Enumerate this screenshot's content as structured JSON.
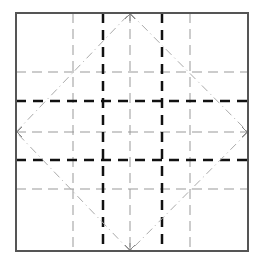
{
  "diagram": {
    "title": "",
    "type": "origami crease pattern",
    "colors": {
      "border": "#555555",
      "valley_thin": "#999999",
      "mountain_thick": "#111111",
      "diagonal": "#aaaaaa"
    },
    "box": {
      "x1": 16,
      "y1": 13,
      "x2": 248,
      "y2": 251
    },
    "thin_vertical_x": [
      73,
      130,
      190
    ],
    "thick_vertical_x": [
      103,
      162
    ],
    "thin_horizontal_y": [
      72,
      132,
      189
    ],
    "thick_horizontal_y": [
      101,
      160
    ],
    "diamond": {
      "top": [
        130,
        13
      ],
      "right": [
        248,
        132
      ],
      "bottom": [
        130,
        251
      ],
      "left": [
        16,
        132
      ]
    },
    "arrows": [
      "top",
      "right",
      "bottom",
      "left"
    ]
  }
}
